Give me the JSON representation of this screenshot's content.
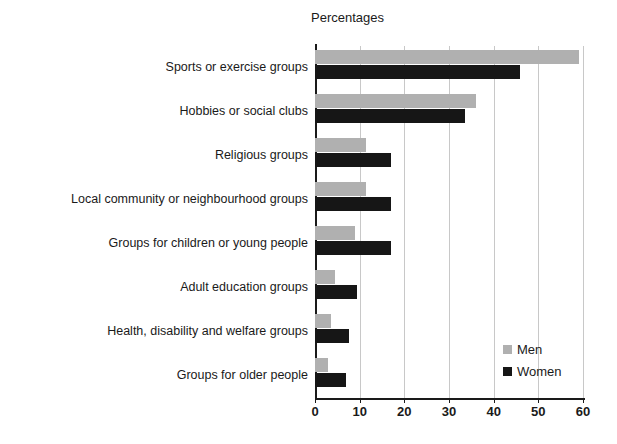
{
  "chart_data": {
    "type": "bar",
    "orientation": "horizontal",
    "title": "Percentages",
    "xlabel": "",
    "ylabel": "",
    "xlim": [
      0,
      60
    ],
    "xticks": [
      0,
      10,
      20,
      30,
      40,
      50,
      60
    ],
    "grid": true,
    "legend_position": "bottom-right",
    "categories": [
      "Sports or exercise groups",
      "Hobbies or social clubs",
      "Religious groups",
      "Local community or neighbourhood groups",
      "Groups for children or young people",
      "Adult education groups",
      "Health, disability and welfare groups",
      "Groups for older people"
    ],
    "series": [
      {
        "name": "Men",
        "color": "#b0b0b0",
        "values": [
          59,
          36,
          11.5,
          11.5,
          9,
          4.5,
          3.5,
          3
        ]
      },
      {
        "name": "Women",
        "color": "#161616",
        "values": [
          46,
          33.5,
          17,
          17,
          17,
          9.5,
          7.5,
          7
        ]
      }
    ]
  },
  "legend": {
    "items": [
      {
        "label": "Men",
        "color": "#b0b0b0"
      },
      {
        "label": "Women",
        "color": "#161616"
      }
    ]
  }
}
